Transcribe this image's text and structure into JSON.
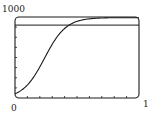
{
  "chart_data": {
    "type": "line",
    "title": "",
    "xlabel": "",
    "ylabel": "",
    "xlim": [
      0,
      10
    ],
    "ylim": [
      0,
      1000
    ],
    "tick_labels": {
      "y_top": "1000",
      "x_left": "0",
      "x_right": "1"
    },
    "x_ticks_count": 10,
    "y_ticks_count": 8,
    "grid": false,
    "series": [
      {
        "name": "logistic curve",
        "x": [
          0,
          1,
          2,
          3,
          4,
          5,
          6,
          7,
          8,
          9,
          10
        ],
        "values": [
          60,
          169,
          389,
          670,
          865,
          953,
          985,
          995,
          998,
          999,
          1000
        ]
      },
      {
        "name": "horizontal reference line",
        "x": [
          0,
          10
        ],
        "values": [
          900,
          900
        ]
      }
    ],
    "colors": {
      "line": "#1a1a1a",
      "frame": "#1a1a1a",
      "background": "#ffffff"
    }
  }
}
